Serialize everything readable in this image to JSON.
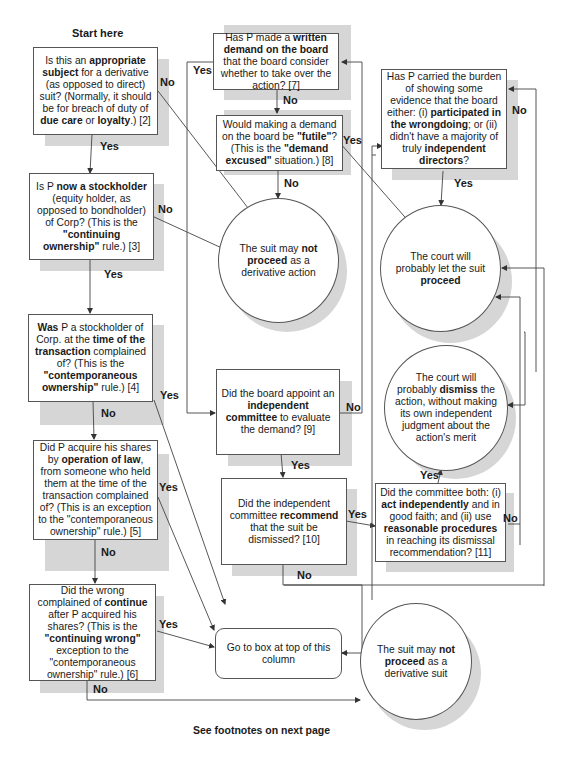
{
  "header": {
    "start_label": "Start here"
  },
  "footer": {
    "note": "See footnotes on next page"
  },
  "nodes": {
    "q2": {
      "segments": [
        [
          "Is this an ",
          false
        ],
        [
          "appropriate subject",
          true
        ],
        [
          " for a derivative (as opposed to direct) suit? (Normally, it should be for breach of duty of ",
          false
        ],
        [
          "due care",
          true
        ],
        [
          " or ",
          false
        ],
        [
          "loyalty",
          true
        ],
        [
          ".) [2]",
          false
        ]
      ]
    },
    "q3": {
      "segments": [
        [
          "Is P ",
          false
        ],
        [
          "now a stockholder",
          true
        ],
        [
          " (equity holder, as opposed to bondholder) of Corp? (This is the ",
          false
        ],
        [
          "\"continuing ownership\"",
          true
        ],
        [
          " rule.) [3]",
          false
        ]
      ]
    },
    "q4": {
      "segments": [
        [
          "Was",
          true
        ],
        [
          " P a stockholder of Corp. at the ",
          false
        ],
        [
          "time of the transaction",
          true
        ],
        [
          " complained of? (This is the ",
          false
        ],
        [
          "\"contemporaneous ownership\"",
          true
        ],
        [
          " rule.) [4]",
          false
        ]
      ]
    },
    "q5": {
      "segments": [
        [
          "Did P acquire his shares by ",
          false
        ],
        [
          "operation of law",
          true
        ],
        [
          ", from someone who held them at the time of the transaction complained of? (This is an exception to the \"contemporaneous ownership\" rule.) [5]",
          false
        ]
      ]
    },
    "q6": {
      "segments": [
        [
          "Did the wrong complained of ",
          false
        ],
        [
          "continue",
          true
        ],
        [
          " after P acquired his shares? (This is the ",
          false
        ],
        [
          "\"continuing wrong\"",
          true
        ],
        [
          " exception to the \"contemporaneous ownership\" rule.) [6]",
          false
        ]
      ]
    },
    "q7": {
      "segments": [
        [
          "Has P made a ",
          false
        ],
        [
          "written demand on the board",
          true
        ],
        [
          " that the board consider whether to take over the action? [7]",
          false
        ]
      ]
    },
    "q8": {
      "segments": [
        [
          "Would making a demand on the board be ",
          false
        ],
        [
          "\"futile\"",
          true
        ],
        [
          "? (This is the ",
          false
        ],
        [
          "\"demand excused\"",
          true
        ],
        [
          " situation.) [8]",
          false
        ]
      ]
    },
    "q9": {
      "segments": [
        [
          "Did the board appoint an ",
          false
        ],
        [
          "independent committee",
          true
        ],
        [
          " to evaluate the demand? [9]",
          false
        ]
      ]
    },
    "q10": {
      "segments": [
        [
          "Did the independent committee ",
          false
        ],
        [
          "recommend",
          true
        ],
        [
          " that the suit be dismissed? [10]",
          false
        ]
      ]
    },
    "q11": {
      "segments": [
        [
          "Did the committee both: (i) ",
          false
        ],
        [
          "act independently",
          true
        ],
        [
          " and in good faith; and (ii) use ",
          false
        ],
        [
          "reasonable procedures",
          true
        ],
        [
          " in reaching its dismissal recommendation? [11]",
          false
        ]
      ]
    },
    "q_burden": {
      "segments": [
        [
          "Has P carried the burden of showing some evidence that the board either: (i) ",
          false
        ],
        [
          "participated in the wrongdoing",
          true
        ],
        [
          "; or (ii) didn't have a majority of truly ",
          false
        ],
        [
          "independent directors",
          true
        ],
        [
          "?",
          false
        ]
      ]
    },
    "goto": {
      "segments": [
        [
          "Go to box at top of this column",
          false
        ]
      ]
    },
    "end_not_action": {
      "segments": [
        [
          "The suit may ",
          false
        ],
        [
          "not proceed",
          true
        ],
        [
          " as a derivative action",
          false
        ]
      ]
    },
    "end_not_suit": {
      "segments": [
        [
          "The suit may ",
          false
        ],
        [
          "not proceed",
          true
        ],
        [
          " as a derivative suit",
          false
        ]
      ]
    },
    "end_proceed": {
      "segments": [
        [
          "The court will probably let the suit ",
          false
        ],
        [
          "proceed",
          true
        ]
      ]
    },
    "end_dismiss": {
      "segments": [
        [
          "The court will probably ",
          false
        ],
        [
          "dismiss",
          true
        ],
        [
          " the action, without making its own independent judgment about the action's merit",
          false
        ]
      ]
    }
  },
  "edge_labels": {
    "q2_no": "No",
    "q2_yes": "Yes",
    "q3_no": "No",
    "q3_yes": "Yes",
    "q4_yes": "Yes",
    "q4_no": "No",
    "q5_yes": "Yes",
    "q5_no": "No",
    "q6_yes": "Yes",
    "q6_no": "No",
    "q7_yes": "Yes",
    "q7_no": "No",
    "q8_yes": "Yes",
    "q8_no": "No",
    "q9_no": "No",
    "q9_yes": "Yes",
    "q10_yes": "Yes",
    "q10_no": "No",
    "q11_yes": "Yes",
    "q11_no": "No",
    "burden_no": "No",
    "burden_yes": "Yes"
  }
}
